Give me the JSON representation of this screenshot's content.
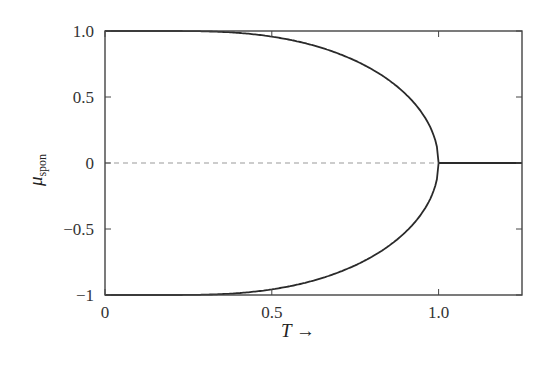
{
  "chart_data": {
    "type": "line",
    "title": "",
    "xlabel": "T →",
    "ylabel": "μ",
    "ylabel_subscript": "spon",
    "xlim": [
      0,
      1.25
    ],
    "ylim": [
      -1,
      1
    ],
    "grid": false,
    "legend": null,
    "x_ticks": [
      0,
      0.5,
      1.0
    ],
    "x_tick_labels": [
      "0",
      "0.5",
      "1.0"
    ],
    "y_ticks": [
      1.0,
      0.5,
      0,
      -0.5,
      -1
    ],
    "y_tick_labels": [
      "1.0",
      "0.5",
      "0",
      "−0.5",
      "−1"
    ],
    "series": [
      {
        "name": "upper branch",
        "style": "solid",
        "x": [
          0,
          0.1,
          0.2,
          0.3,
          0.4,
          0.5,
          0.6,
          0.7,
          0.8,
          0.85,
          0.9,
          0.95,
          0.98,
          0.99,
          1.0
        ],
        "y": [
          1.0,
          1.0,
          1.0,
          0.9974,
          0.9869,
          0.9575,
          0.9073,
          0.8286,
          0.7104,
          0.6296,
          0.5254,
          0.379,
          0.2428,
          0.173,
          0
        ]
      },
      {
        "name": "lower branch",
        "style": "solid",
        "x": [
          0,
          0.1,
          0.2,
          0.3,
          0.4,
          0.5,
          0.6,
          0.7,
          0.8,
          0.85,
          0.9,
          0.95,
          0.98,
          0.99,
          1.0
        ],
        "y": [
          -1.0,
          -1.0,
          -1.0,
          -0.9974,
          -0.9869,
          -0.9575,
          -0.9073,
          -0.8286,
          -0.7104,
          -0.6296,
          -0.5254,
          -0.379,
          -0.2428,
          -0.173,
          0
        ]
      },
      {
        "name": "zero (unstable, T<1)",
        "style": "dashed",
        "x": [
          0,
          1.0
        ],
        "y": [
          0,
          0
        ]
      },
      {
        "name": "zero (T>1)",
        "style": "solid",
        "x": [
          1.0,
          1.25
        ],
        "y": [
          0,
          0
        ]
      }
    ]
  },
  "colors": {
    "axis": "#444444",
    "curve": "#2a2a2a",
    "dashed": "#999999"
  }
}
